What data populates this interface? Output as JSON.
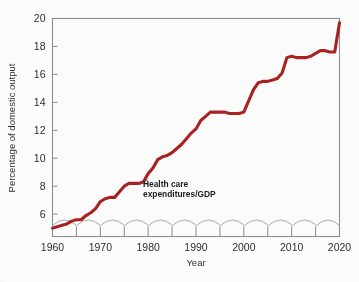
{
  "chart_data": {
    "type": "line",
    "title": "",
    "xlabel": "Year",
    "ylabel": "Percentage of domestic output",
    "xlim": [
      1960,
      2020
    ],
    "ylim": [
      4.4,
      20
    ],
    "grid": false,
    "legend": "none",
    "axis_break": true,
    "y_ticks": [
      6,
      8,
      10,
      12,
      14,
      16,
      18,
      20
    ],
    "y_tick_labels": [
      "6",
      "8",
      "10",
      "12",
      "14",
      "16",
      "18",
      "20"
    ],
    "x_ticks": [
      1960,
      1965,
      1970,
      1975,
      1980,
      1985,
      1990,
      1995,
      2000,
      2005,
      2010,
      2015,
      2020
    ],
    "x_tick_labels_major": [
      "1960",
      "1970",
      "1980",
      "1990",
      "2000",
      "2010",
      "2020"
    ],
    "x_major_ticks": [
      1960,
      1970,
      1980,
      1990,
      2000,
      2010,
      2020
    ],
    "annotations": [
      {
        "text_line1": "Health care",
        "text_line2": "expenditures/GDP",
        "points_to_year": 1980,
        "points_to_value": 8.6
      }
    ],
    "series": [
      {
        "name": "Health care expenditures/GDP",
        "color": "#a82222",
        "x": [
          1960,
          1961,
          1962,
          1963,
          1964,
          1965,
          1966,
          1967,
          1968,
          1969,
          1970,
          1971,
          1972,
          1973,
          1974,
          1975,
          1976,
          1977,
          1978,
          1979,
          1980,
          1981,
          1982,
          1983,
          1984,
          1985,
          1986,
          1987,
          1988,
          1989,
          1990,
          1991,
          1992,
          1993,
          1994,
          1995,
          1996,
          1997,
          1998,
          1999,
          2000,
          2001,
          2002,
          2003,
          2004,
          2005,
          2006,
          2007,
          2008,
          2009,
          2010,
          2011,
          2012,
          2013,
          2014,
          2015,
          2016,
          2017,
          2018,
          2019,
          2020
        ],
        "values": [
          5.0,
          5.1,
          5.2,
          5.3,
          5.5,
          5.6,
          5.6,
          5.9,
          6.1,
          6.4,
          6.9,
          7.1,
          7.2,
          7.2,
          7.6,
          8.0,
          8.2,
          8.2,
          8.2,
          8.3,
          8.9,
          9.3,
          9.9,
          10.1,
          10.2,
          10.4,
          10.7,
          11.0,
          11.4,
          11.8,
          12.1,
          12.7,
          13.0,
          13.3,
          13.3,
          13.3,
          13.3,
          13.2,
          13.2,
          13.2,
          13.3,
          14.1,
          14.9,
          15.4,
          15.5,
          15.5,
          15.6,
          15.7,
          16.1,
          17.2,
          17.3,
          17.2,
          17.2,
          17.2,
          17.3,
          17.5,
          17.7,
          17.7,
          17.6,
          17.6,
          19.7
        ]
      }
    ]
  },
  "axes": {
    "y_axis_title": "Percentage of domestic output",
    "x_axis_title": "Year"
  },
  "colors": {
    "series": "#a82222",
    "frame": "#8d8d91",
    "text": "#2f2f2f",
    "background": "#fbfbfc"
  }
}
